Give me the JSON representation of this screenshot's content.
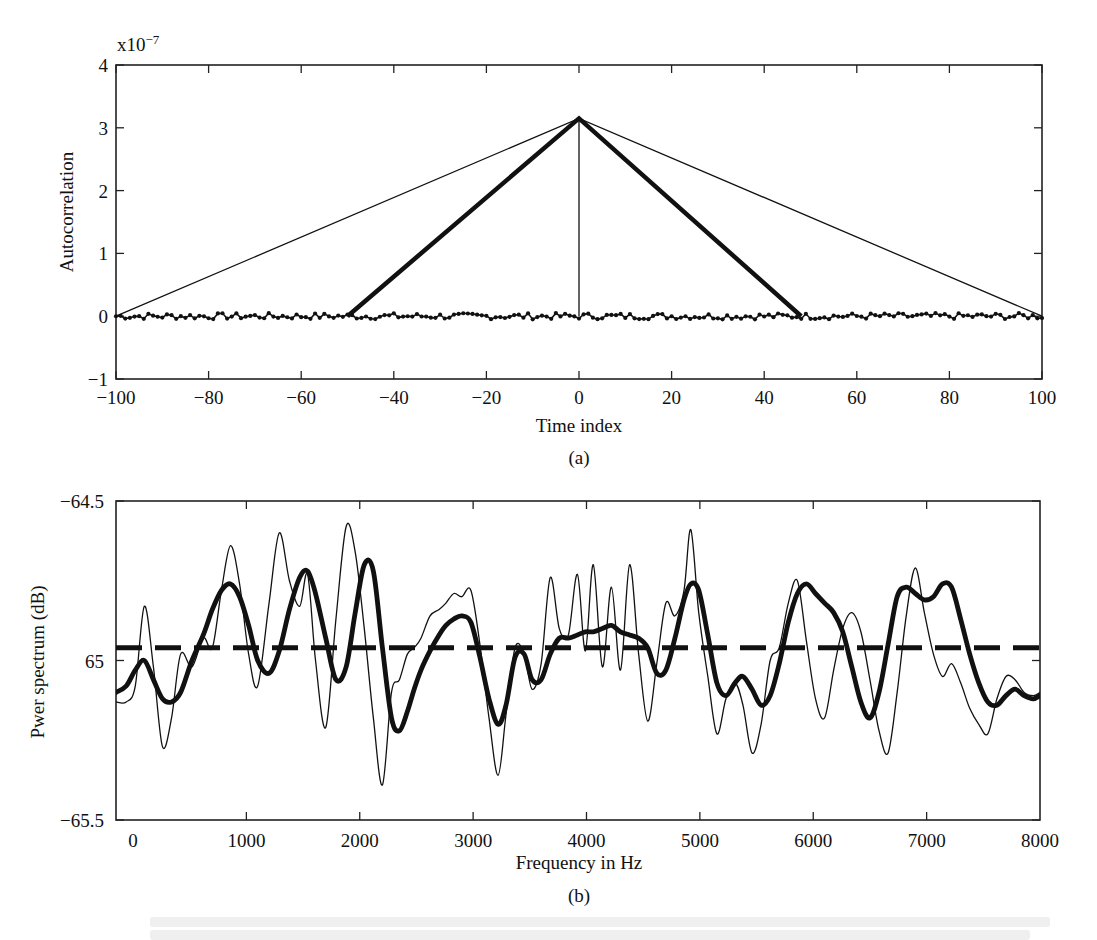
{
  "figure": {
    "panel_a": {
      "caption": "(a)",
      "xlabel": "Time index",
      "ylabel": "Autocorrelation",
      "exponent_label": "x10",
      "exponent_power": "−7",
      "xticks": [
        "−100",
        "−80",
        "−60",
        "−40",
        "−20",
        "0",
        "20",
        "40",
        "60",
        "80",
        "100"
      ],
      "yticks": [
        "−1",
        "0",
        "1",
        "2",
        "3",
        "4"
      ]
    },
    "panel_b": {
      "caption": "(b)",
      "xlabel": "Frequency in Hz",
      "ylabel": "Pwer spectrum (dB)",
      "xticks": [
        "0",
        "1000",
        "2000",
        "3000",
        "4000",
        "5000",
        "6000",
        "7000",
        "8000"
      ],
      "yticks": [
        "−65.5",
        "65",
        "−64.5"
      ]
    }
  },
  "chart_data": [
    {
      "type": "line",
      "title": "",
      "caption": "(a)",
      "xlabel": "Time index",
      "ylabel": "Autocorrelation",
      "y_scale_note": "x10^-7",
      "xlim": [
        -100,
        100
      ],
      "ylim": [
        -1,
        4
      ],
      "xticks": [
        -100,
        -80,
        -60,
        -40,
        -20,
        0,
        20,
        40,
        60,
        80,
        100
      ],
      "yticks": [
        -1,
        0,
        1,
        2,
        3,
        4
      ],
      "grid": false,
      "legend": null,
      "series": [
        {
          "name": "thin triangular window (full length)",
          "style": "thin solid",
          "x": [
            -100,
            0,
            100
          ],
          "y": [
            0,
            3.15,
            0
          ]
        },
        {
          "name": "thick triangular window (half length)",
          "style": "thick solid",
          "x": [
            -50,
            0,
            48
          ],
          "y": [
            0,
            3.15,
            0
          ]
        },
        {
          "name": "impulse at zero lag",
          "style": "thin solid",
          "x": [
            0,
            0
          ],
          "y": [
            0,
            3.15
          ]
        },
        {
          "name": "noisy autocorrelation estimate",
          "style": "dotted markers",
          "x_range": [
            -100,
            100
          ],
          "y_approx": 0,
          "amplitude": 0.05
        }
      ]
    },
    {
      "type": "line",
      "title": "",
      "caption": "(b)",
      "xlabel": "Frequency in Hz",
      "ylabel": "Pwer spectrum (dB)",
      "xlim": [
        -150,
        8000
      ],
      "ylim": [
        -65.5,
        -64.5
      ],
      "xticks": [
        0,
        1000,
        2000,
        3000,
        4000,
        5000,
        6000,
        7000,
        8000
      ],
      "yticks": [
        -65.5,
        -65,
        -64.5
      ],
      "ytick_labels": [
        "−65.5",
        "65",
        "−64.5"
      ],
      "grid": false,
      "legend": null,
      "series": [
        {
          "name": "true flat spectrum",
          "style": "thick dashed",
          "x": [
            -150,
            8000
          ],
          "y": [
            -64.96,
            -64.96
          ]
        },
        {
          "name": "thin (high-variance) estimate",
          "style": "thin solid",
          "x": [
            -150,
            -60,
            20,
            100,
            180,
            260,
            340,
            420,
            520,
            620,
            700,
            780,
            860,
            940,
            1020,
            1100,
            1200,
            1290,
            1380,
            1470,
            1540,
            1610,
            1700,
            1790,
            1880,
            1960,
            2040,
            2120,
            2200,
            2280,
            2350,
            2420,
            2480,
            2540,
            2620,
            2700,
            2760,
            2830,
            2900,
            2980,
            3060,
            3140,
            3220,
            3290,
            3370,
            3450,
            3520,
            3600,
            3680,
            3760,
            3840,
            3920,
            3990,
            4060,
            4140,
            4220,
            4300,
            4380,
            4460,
            4540,
            4620,
            4700,
            4780,
            4860,
            4920,
            4990,
            5070,
            5150,
            5230,
            5310,
            5380,
            5460,
            5540,
            5620,
            5700,
            5780,
            5860,
            5940,
            6020,
            6100,
            6180,
            6260,
            6340,
            6420,
            6500,
            6580,
            6660,
            6740,
            6820,
            6900,
            6980,
            7060,
            7140,
            7220,
            7300,
            7380,
            7460,
            7540,
            7620,
            7700,
            7780,
            7860,
            7940,
            8000
          ],
          "y": [
            -65.13,
            -65.13,
            -65.08,
            -64.83,
            -65.02,
            -65.27,
            -65.18,
            -64.98,
            -65.02,
            -64.93,
            -64.96,
            -64.78,
            -64.64,
            -64.76,
            -64.98,
            -65.08,
            -64.82,
            -64.6,
            -64.75,
            -64.83,
            -64.73,
            -65.0,
            -65.21,
            -64.87,
            -64.58,
            -64.66,
            -64.9,
            -65.18,
            -65.39,
            -65.1,
            -65.06,
            -64.98,
            -64.96,
            -64.93,
            -64.86,
            -64.84,
            -64.82,
            -64.79,
            -64.8,
            -64.78,
            -64.95,
            -65.18,
            -65.36,
            -65.17,
            -64.96,
            -64.98,
            -65.09,
            -65.01,
            -64.74,
            -64.9,
            -64.92,
            -64.73,
            -64.97,
            -64.7,
            -65.02,
            -64.77,
            -65.03,
            -64.7,
            -64.98,
            -65.19,
            -65.01,
            -64.82,
            -64.86,
            -64.78,
            -64.59,
            -64.85,
            -65.05,
            -65.23,
            -65.12,
            -65.07,
            -65.14,
            -65.29,
            -65.2,
            -65.0,
            -64.96,
            -64.82,
            -64.75,
            -64.94,
            -65.12,
            -65.18,
            -65.03,
            -64.9,
            -64.85,
            -64.91,
            -65.06,
            -65.22,
            -65.29,
            -65.1,
            -64.86,
            -64.71,
            -64.85,
            -64.98,
            -65.05,
            -65.01,
            -65.07,
            -65.15,
            -65.2,
            -65.23,
            -65.12,
            -65.05,
            -65.06,
            -65.1,
            -65.11,
            -65.1
          ]
        },
        {
          "name": "thick (smoothed) estimate",
          "style": "thick solid",
          "x": [
            -150,
            -60,
            20,
            100,
            180,
            260,
            340,
            420,
            520,
            620,
            700,
            780,
            860,
            940,
            1020,
            1100,
            1200,
            1290,
            1380,
            1470,
            1540,
            1610,
            1700,
            1790,
            1880,
            1960,
            2040,
            2120,
            2200,
            2280,
            2350,
            2420,
            2480,
            2540,
            2620,
            2700,
            2760,
            2830,
            2900,
            2980,
            3060,
            3140,
            3220,
            3290,
            3370,
            3450,
            3520,
            3600,
            3680,
            3760,
            3840,
            3920,
            3990,
            4060,
            4140,
            4220,
            4300,
            4380,
            4460,
            4540,
            4620,
            4700,
            4780,
            4860,
            4920,
            4990,
            5070,
            5150,
            5230,
            5310,
            5380,
            5460,
            5540,
            5620,
            5700,
            5780,
            5860,
            5940,
            6020,
            6100,
            6180,
            6260,
            6340,
            6420,
            6500,
            6580,
            6660,
            6740,
            6820,
            6900,
            6980,
            7060,
            7140,
            7220,
            7300,
            7380,
            7460,
            7540,
            7620,
            7700,
            7780,
            7860,
            7940,
            8000
          ],
          "y": [
            -65.1,
            -65.08,
            -65.03,
            -65.0,
            -65.06,
            -65.12,
            -65.13,
            -65.1,
            -65.0,
            -64.92,
            -64.84,
            -64.78,
            -64.76,
            -64.8,
            -64.89,
            -65.0,
            -65.04,
            -64.97,
            -64.84,
            -64.74,
            -64.72,
            -64.79,
            -64.93,
            -65.06,
            -65.02,
            -64.85,
            -64.7,
            -64.72,
            -64.96,
            -65.18,
            -65.22,
            -65.16,
            -65.09,
            -65.03,
            -64.97,
            -64.92,
            -64.89,
            -64.87,
            -64.86,
            -64.88,
            -64.99,
            -65.12,
            -65.2,
            -65.14,
            -64.99,
            -64.98,
            -65.06,
            -65.06,
            -64.98,
            -64.93,
            -64.93,
            -64.92,
            -64.91,
            -64.91,
            -64.9,
            -64.89,
            -64.91,
            -64.92,
            -64.93,
            -64.96,
            -65.04,
            -65.03,
            -64.93,
            -64.81,
            -64.76,
            -64.78,
            -64.92,
            -65.07,
            -65.11,
            -65.07,
            -65.05,
            -65.09,
            -65.14,
            -65.11,
            -65.01,
            -64.88,
            -64.79,
            -64.76,
            -64.79,
            -64.82,
            -64.85,
            -64.91,
            -65.02,
            -65.13,
            -65.18,
            -65.1,
            -64.95,
            -64.8,
            -64.77,
            -64.79,
            -64.81,
            -64.8,
            -64.76,
            -64.77,
            -64.87,
            -64.98,
            -65.07,
            -65.13,
            -65.14,
            -65.11,
            -65.09,
            -65.11,
            -65.12,
            -65.11
          ]
        }
      ]
    }
  ]
}
